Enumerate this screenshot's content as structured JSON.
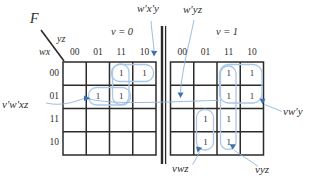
{
  "figure": {
    "function_label": "F",
    "col_var": "yz",
    "row_var": "wx",
    "col_labels": [
      "00",
      "01",
      "11",
      "10"
    ],
    "row_labels": [
      "00",
      "01",
      "11",
      "10"
    ],
    "cell_symbol": "1",
    "maps": [
      {
        "title": "v = 0",
        "ones": [
          [
            0,
            2
          ],
          [
            0,
            3
          ],
          [
            1,
            1
          ],
          [
            1,
            2
          ]
        ]
      },
      {
        "title": "v = 1",
        "ones": [
          [
            0,
            2
          ],
          [
            0,
            3
          ],
          [
            1,
            2
          ],
          [
            1,
            3
          ],
          [
            2,
            1
          ],
          [
            2,
            2
          ],
          [
            3,
            1
          ],
          [
            3,
            2
          ]
        ]
      }
    ],
    "annotations": {
      "top_left": "w′x′y",
      "top_mid": "w′yz",
      "left": "v′w′xz",
      "right": "vw′y",
      "bottom_left": "vwz",
      "bottom_right": "vyz"
    },
    "colors": {
      "grid": "#2b2b2b",
      "group": "#aac7e5",
      "leader": "#8fb6da",
      "arrow": "#3a72b0",
      "text": "#2e2e2e"
    }
  }
}
